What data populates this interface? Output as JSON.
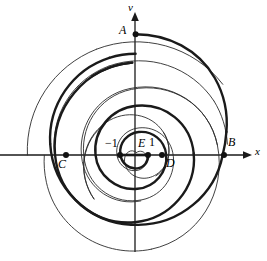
{
  "figure": {
    "background": "#ffffff",
    "stroke_color": "#1a1a1a",
    "axes": {
      "x_axis_label": "x",
      "y_axis_label": "v",
      "origin_px": [
        135,
        155
      ],
      "x_axis_y_px": 155,
      "y_axis_x_px": 135,
      "x_arrow_tip_px": [
        252,
        155
      ],
      "y_arrow_tip_px": [
        135,
        12
      ],
      "x_axis_left_end_px": 0,
      "y_axis_bottom_end_px": 252
    },
    "tick_labels": {
      "minus_one": "−1",
      "one": "1"
    },
    "points": [
      {
        "id": "A",
        "label": "A",
        "x_px": 135,
        "y_px": 34,
        "label_x_px": 119,
        "label_y_px": 24,
        "dot": true
      },
      {
        "id": "B",
        "label": "B",
        "x_px": 224,
        "y_px": 155,
        "label_x_px": 228,
        "label_y_px": 136,
        "dot": true
      },
      {
        "id": "C",
        "label": "C",
        "x_px": 66,
        "y_px": 155,
        "label_x_px": 58,
        "label_y_px": 160,
        "dot": true
      },
      {
        "id": "D",
        "label": "D",
        "x_px": 162,
        "y_px": 155,
        "label_x_px": 166,
        "label_y_px": 158,
        "dot": true
      },
      {
        "id": "E",
        "label": "E",
        "x_px": 148,
        "y_px": 155,
        "label_x_px": 138,
        "label_y_px": 136,
        "dot": true
      },
      {
        "id": "M1",
        "label": "−1",
        "x_px": 120,
        "y_px": 155,
        "label_x_px": 106,
        "label_y_px": 136,
        "dot": true
      }
    ],
    "segment": {
      "name": "thick-x-segment",
      "from_px": [
        120,
        155
      ],
      "to_px": [
        148,
        155
      ],
      "width_px": 2.6
    },
    "curves": [
      {
        "name": "thick-spiral",
        "weight": "thick",
        "width_px": 2.4,
        "description": "Archimedean spiral through E(1), D, A, C, B",
        "center_px": [
          135,
          155
        ],
        "theta_start_deg": 0,
        "theta_end_deg": 720,
        "r_start_px": 13,
        "r_end_px": 89,
        "notes": "passes D at 27px right, A at 121px up, C at 69px left, B at 89px right"
      },
      {
        "name": "thin-spiral",
        "weight": "thin",
        "width_px": 0.9,
        "description": "Interleaved Archimedean spiral offset half a turn",
        "center_px": [
          135,
          155
        ],
        "theta_start_deg": 0,
        "theta_end_deg": 720,
        "r_start_px": 2,
        "r_end_px": 113,
        "notes": "terminates on negative x-axis near x=22"
      }
    ]
  }
}
